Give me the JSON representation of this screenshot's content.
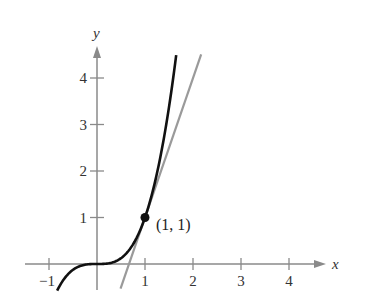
{
  "chart_data": {
    "type": "line",
    "title": "",
    "xlabel": "x",
    "ylabel": "y",
    "xlim": [
      -1.3,
      4.8
    ],
    "ylim": [
      -0.55,
      4.8
    ],
    "x_ticks": [
      -1,
      1,
      2,
      3,
      4
    ],
    "x_tick_labels": [
      "−1",
      "1",
      "2",
      "3",
      "4"
    ],
    "y_ticks": [
      1,
      2,
      3,
      4
    ],
    "y_tick_labels": [
      "1",
      "2",
      "3",
      "4"
    ],
    "grid": false,
    "series": [
      {
        "name": "f(x) = x^3",
        "color": "#111111",
        "x_range": [
          -0.83,
          1.65
        ],
        "function": "x^3"
      },
      {
        "name": "tangent line y = 3x - 2",
        "color": "#9a9a9a",
        "x_range": [
          0.49,
          2.17
        ],
        "function": "3x-2"
      }
    ],
    "annotations": [
      {
        "type": "point",
        "x": 1,
        "y": 1,
        "label": "(1, 1)"
      }
    ]
  }
}
